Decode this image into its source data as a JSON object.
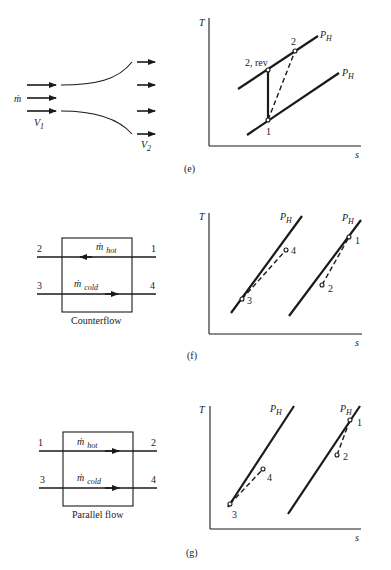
{
  "figure": {
    "panels": [
      {
        "id": "e",
        "caption": "(e)",
        "left": {
          "type": "nozzle",
          "mass_flow_label": "ṁ",
          "inlet_velocity": "V",
          "inlet_velocity_sub": "1",
          "outlet_velocity": "V",
          "outlet_velocity_sub": "2"
        },
        "right": {
          "type": "T-s diagram",
          "y_axis": "T",
          "x_axis": "s",
          "isobars": [
            {
              "label": "P",
              "sub": "H"
            },
            {
              "label": "P",
              "sub": "H"
            }
          ],
          "points": [
            "1",
            "2",
            "2, rev"
          ]
        }
      },
      {
        "id": "f",
        "caption": "(f)",
        "left": {
          "type": "heat exchanger",
          "title": "Counterflow",
          "hot_label": "ṁ",
          "hot_sub": "hot",
          "cold_label": "ṁ",
          "cold_sub": "cold",
          "ports": {
            "hot_out": "2",
            "hot_in": "1",
            "cold_in": "3",
            "cold_out": "4"
          }
        },
        "right": {
          "type": "T-s diagram",
          "y_axis": "T",
          "x_axis": "s",
          "isobars": [
            {
              "label": "P",
              "sub": "H"
            },
            {
              "label": "P",
              "sub": "H"
            }
          ],
          "points": [
            "1",
            "2",
            "3",
            "4"
          ]
        }
      },
      {
        "id": "g",
        "caption": "(g)",
        "left": {
          "type": "heat exchanger",
          "title": "Parallel flow",
          "hot_label": "ṁ",
          "hot_sub": "hot",
          "cold_label": "ṁ",
          "cold_sub": "cold",
          "ports": {
            "hot_in": "1",
            "hot_out": "2",
            "cold_in": "3",
            "cold_out": "4"
          }
        },
        "right": {
          "type": "T-s diagram",
          "y_axis": "T",
          "x_axis": "s",
          "isobars": [
            {
              "label": "P",
              "sub": "H"
            },
            {
              "label": "P",
              "sub": "H"
            }
          ],
          "points": [
            "1",
            "2",
            "3",
            "4"
          ]
        }
      }
    ]
  }
}
